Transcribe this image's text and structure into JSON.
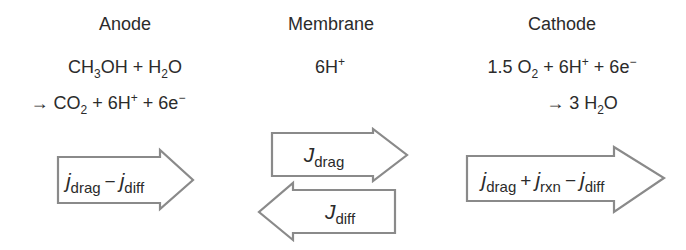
{
  "diagram": {
    "columns": [
      {
        "id": "anode",
        "title": "Anode",
        "reaction_line1": {
          "a": "CH",
          "a_sub": "3",
          "b": "OH + H",
          "b_sub": "2",
          "c": "O"
        },
        "reaction_line2": {
          "a": "→ CO",
          "a_sub": "2",
          "b": " + 6H",
          "b_sup": "+",
          "c": " + 6e",
          "c_sup": "−"
        },
        "flux_arrows": [
          {
            "direction": "right",
            "terms": [
              {
                "symbol": "j",
                "sub": "drag"
              },
              {
                "op": "−"
              },
              {
                "symbol": "j",
                "sub": "diff"
              }
            ]
          }
        ]
      },
      {
        "id": "membrane",
        "title": "Membrane",
        "species": {
          "a": "6H",
          "a_sup": "+"
        },
        "flux_arrows": [
          {
            "direction": "right",
            "terms": [
              {
                "symbol": "J",
                "sub": "drag"
              }
            ]
          },
          {
            "direction": "left",
            "terms": [
              {
                "symbol": "J",
                "sub": "diff"
              }
            ]
          }
        ]
      },
      {
        "id": "cathode",
        "title": "Cathode",
        "reaction_line1": {
          "a": "1.5 O",
          "a_sub": "2",
          "b": " + 6H",
          "b_sup": "+",
          "c": " + 6e",
          "c_sup": "−"
        },
        "reaction_line2": {
          "a": "→ 3 H",
          "a_sub": "2",
          "b": "O"
        },
        "flux_arrows": [
          {
            "direction": "right",
            "terms": [
              {
                "symbol": "j",
                "sub": "drag"
              },
              {
                "op": "+"
              },
              {
                "symbol": "j",
                "sub": "rxn"
              },
              {
                "op": "−"
              },
              {
                "symbol": "j",
                "sub": "diff"
              }
            ]
          }
        ]
      }
    ],
    "colors": {
      "text": "#2b2b2b",
      "arrow_stroke": "#8a8a8a",
      "arrow_fill": "#ffffff",
      "background": "#ffffff"
    }
  }
}
